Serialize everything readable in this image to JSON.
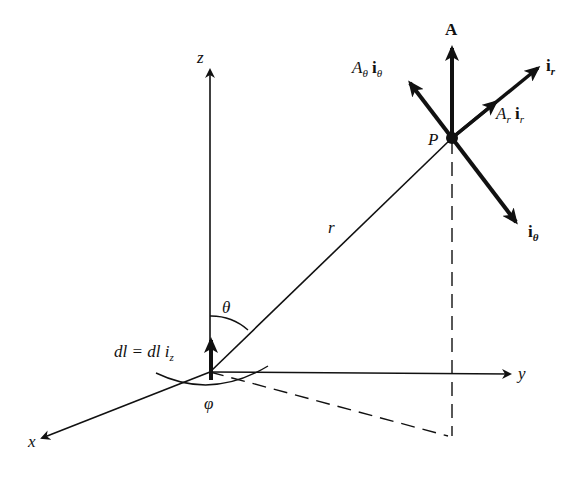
{
  "diagram": {
    "labels": {
      "z": "z",
      "x": "x",
      "y": "y",
      "A": "A",
      "P": "P",
      "r": "r",
      "theta": "θ",
      "phi": "φ",
      "dl": "dl = dl i",
      "dl_sub": "z",
      "ir": "i",
      "ir_sub": "r",
      "itheta": "i",
      "itheta_sub": "θ",
      "Ar_A": "A",
      "Ar_sub1": "r",
      "Ar_i": "i",
      "Ar_sub2": "r",
      "At_A": "A",
      "At_sub1": "θ",
      "At_i": "i",
      "At_sub2": "θ"
    },
    "colors": {
      "ink": "#111111",
      "background": "#ffffff"
    }
  }
}
